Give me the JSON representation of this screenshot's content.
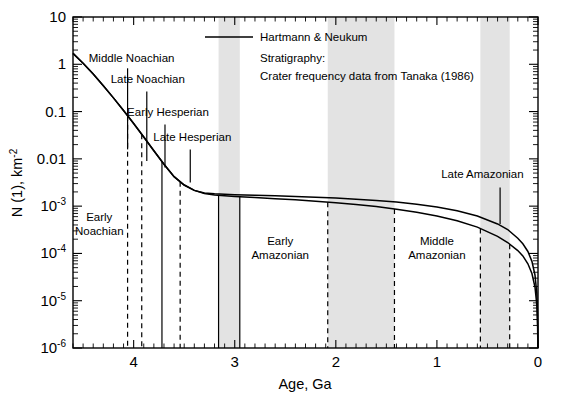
{
  "chart_data": {
    "type": "line",
    "title": "",
    "xlabel": "Age, Ga",
    "ylabel": "N (1), km",
    "ylabel_sup": "-2",
    "xlim": [
      4.6,
      0
    ],
    "ylim": [
      1e-06,
      10
    ],
    "x_reversed": true,
    "yscale": "log",
    "grid": false,
    "x_ticks": [
      4,
      3,
      2,
      1,
      0
    ],
    "x_tick_labels": [
      "4",
      "3",
      "2",
      "1",
      "0"
    ],
    "y_ticks": [
      10,
      1,
      0.1,
      0.01,
      0.001,
      0.0001,
      1e-05,
      1e-06
    ],
    "y_tick_labels": [
      "10",
      "1",
      "0.1",
      "0.01",
      "10",
      "10",
      "10",
      "10"
    ],
    "y_tick_sups": [
      "",
      "",
      "",
      "",
      "-3",
      "-4",
      "-5",
      "-6"
    ],
    "legend_position": "top-center",
    "legend": [
      {
        "label": "Hartmann & Neukum",
        "marker": "line",
        "color": "#000000"
      }
    ],
    "annotations": [
      "Stratigraphy:",
      "Crater frequency data  from Tanaka (1986)"
    ],
    "series": [
      {
        "name": "Hartmann",
        "color": "#000000",
        "points": [
          [
            4.6,
            1.7
          ],
          [
            4.5,
            1.05
          ],
          [
            4.4,
            0.62
          ],
          [
            4.3,
            0.35
          ],
          [
            4.2,
            0.195
          ],
          [
            4.1,
            0.105
          ],
          [
            4.0,
            0.056
          ],
          [
            3.9,
            0.029
          ],
          [
            3.8,
            0.0148
          ],
          [
            3.7,
            0.0077
          ],
          [
            3.6,
            0.0042
          ],
          [
            3.5,
            0.0028
          ],
          [
            3.4,
            0.00215
          ],
          [
            3.3,
            0.00185
          ],
          [
            3.2,
            0.00172
          ],
          [
            3.1,
            0.00165
          ],
          [
            3.0,
            0.0016
          ],
          [
            2.8,
            0.00152
          ],
          [
            2.6,
            0.00144
          ],
          [
            2.4,
            0.00136
          ],
          [
            2.2,
            0.00127
          ],
          [
            2.0,
            0.00118
          ],
          [
            1.8,
            0.00108
          ],
          [
            1.6,
            0.00098
          ],
          [
            1.4,
            0.00086
          ],
          [
            1.2,
            0.00074
          ],
          [
            1.0,
            0.00062
          ],
          [
            0.8,
            0.00049
          ],
          [
            0.6,
            0.00036
          ],
          [
            0.4,
            0.00023
          ],
          [
            0.3,
            0.00017
          ],
          [
            0.2,
            0.000115
          ],
          [
            0.15,
            8.85e-05
          ],
          [
            0.1,
            6.05e-05
          ],
          [
            0.06,
            3.75e-05
          ],
          [
            0.03,
            1.95e-05
          ],
          [
            0.012,
            8.2e-06
          ],
          [
            0.004,
            2.8e-06
          ],
          [
            0.0015,
            1.1e-06
          ],
          [
            0.0,
            1e-06
          ]
        ]
      },
      {
        "name": "Neukum",
        "color": "#000000",
        "points": [
          [
            4.6,
            1.7
          ],
          [
            4.5,
            1.05
          ],
          [
            4.4,
            0.62
          ],
          [
            4.3,
            0.35
          ],
          [
            4.2,
            0.195
          ],
          [
            4.1,
            0.105
          ],
          [
            4.0,
            0.056
          ],
          [
            3.9,
            0.029
          ],
          [
            3.8,
            0.0148
          ],
          [
            3.7,
            0.0077
          ],
          [
            3.6,
            0.0042
          ],
          [
            3.5,
            0.0028
          ],
          [
            3.4,
            0.00215
          ],
          [
            3.3,
            0.0019
          ],
          [
            3.2,
            0.00182
          ],
          [
            3.1,
            0.00178
          ],
          [
            3.0,
            0.00175
          ],
          [
            2.8,
            0.0017
          ],
          [
            2.6,
            0.00165
          ],
          [
            2.4,
            0.0016
          ],
          [
            2.2,
            0.00154
          ],
          [
            2.0,
            0.00148
          ],
          [
            1.8,
            0.0014
          ],
          [
            1.6,
            0.00132
          ],
          [
            1.4,
            0.00122
          ],
          [
            1.2,
            0.0011
          ],
          [
            1.0,
            0.00096
          ],
          [
            0.8,
            0.0008
          ],
          [
            0.6,
            0.00062
          ],
          [
            0.4,
            0.00042
          ],
          [
            0.3,
            0.00032
          ],
          [
            0.2,
            0.00021
          ],
          [
            0.15,
            0.00016
          ],
          [
            0.1,
            0.00011
          ],
          [
            0.06,
            6.8e-05
          ],
          [
            0.03,
            3.5e-05
          ],
          [
            0.012,
            1.45e-05
          ],
          [
            0.004,
            5e-06
          ],
          [
            0.0015,
            1.9e-06
          ],
          [
            0.0,
            1e-06
          ]
        ]
      }
    ],
    "shaded_bands": [
      {
        "name": "late-hesperian-band",
        "x_start": 3.16,
        "x_end": 2.95,
        "edge": "solid"
      },
      {
        "name": "early-amazonian-band",
        "x_start": 2.08,
        "x_end": 1.42,
        "edge": "dashed"
      },
      {
        "name": "late-amazonian-band",
        "x_start": 0.57,
        "x_end": 0.28,
        "edge": "dashed"
      }
    ],
    "period_boundaries": [
      {
        "name": "boundary-early-middle-noachian",
        "age": 4.06,
        "style": "dashed"
      },
      {
        "name": "boundary-middle-late-noachian",
        "age": 3.92,
        "style": "dashed"
      },
      {
        "name": "boundary-late-noachian-early-hesperian",
        "age": 3.72,
        "style": "solid"
      },
      {
        "name": "boundary-early-late-hesperian",
        "age": 3.54,
        "style": "dashed"
      },
      {
        "name": "boundary-late-hesperian-start",
        "age": 3.16,
        "style": "solid"
      },
      {
        "name": "boundary-early-amazonian-start",
        "age": 2.95,
        "style": "solid"
      },
      {
        "name": "boundary-early-middle-amazonian-a",
        "age": 2.08,
        "style": "dashed"
      },
      {
        "name": "boundary-early-middle-amazonian-b",
        "age": 1.42,
        "style": "dashed"
      },
      {
        "name": "boundary-middle-late-amazonian-a",
        "age": 0.57,
        "style": "dashed"
      },
      {
        "name": "boundary-middle-late-amazonian-b",
        "age": 0.28,
        "style": "dashed"
      }
    ],
    "epoch_labels": [
      {
        "name": "early-noachian",
        "lines": [
          "Early",
          "Noachian"
        ],
        "x": 4.34,
        "y_frac": 0.615,
        "leader": false
      },
      {
        "name": "middle-noachian",
        "lines": [
          "Middle Noachian"
        ],
        "x": 4.02,
        "y_frac": 0.135,
        "leader": true,
        "leader_age": 4.06,
        "leader_y0": 0.155,
        "leader_y1": 0.4
      },
      {
        "name": "late-noachian",
        "lines": [
          "Late Noachian"
        ],
        "x": 3.86,
        "y_frac": 0.2,
        "leader": true,
        "leader_age": 3.87,
        "leader_y0": 0.225,
        "leader_y1": 0.435
      },
      {
        "name": "early-hesperian",
        "lines": [
          "Early Hesperian"
        ],
        "x": 3.66,
        "y_frac": 0.3,
        "leader": true,
        "leader_age": 3.69,
        "leader_y0": 0.325,
        "leader_y1": 0.455
      },
      {
        "name": "late-hesperian",
        "lines": [
          "Late Hesperian"
        ],
        "x": 3.42,
        "y_frac": 0.375,
        "leader": true,
        "leader_age": 3.44,
        "leader_y0": 0.4,
        "leader_y1": 0.5
      },
      {
        "name": "early-amazonian",
        "lines": [
          "Early",
          "Amazonian"
        ],
        "x": 2.55,
        "y_frac": 0.69,
        "leader": false
      },
      {
        "name": "middle-amazonian",
        "lines": [
          "Middle",
          "Amazonian"
        ],
        "x": 1.0,
        "y_frac": 0.69,
        "leader": false
      },
      {
        "name": "late-amazonian",
        "lines": [
          "Late Amazonian"
        ],
        "x": 0.55,
        "y_frac": 0.485,
        "leader": true,
        "leader_age": 0.375,
        "leader_y0": 0.515,
        "leader_y1": 0.625
      }
    ]
  },
  "legend_block": {
    "series_label": "Hartmann & Neukum",
    "note_line1": "Stratigraphy:",
    "note_line2": "Crater frequency data  from Tanaka (1986)"
  },
  "axes": {
    "x_title": "Age, Ga",
    "y_title_main": "N (1), km",
    "y_title_sup": "-2"
  }
}
